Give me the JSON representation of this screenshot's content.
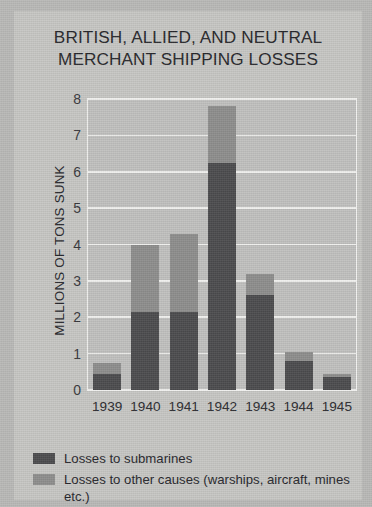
{
  "title": {
    "line1": "BRITISH, ALLIED, AND NEUTRAL",
    "line2": "MERCHANT SHIPPING LOSSES"
  },
  "axis": {
    "ylabel": "MILLIONS OF TONS SUNK"
  },
  "legend": {
    "items": [
      {
        "label": "Losses to submarines",
        "color": "#4c4c4e",
        "swatch_name": "legend-swatch-submarines"
      },
      {
        "label": "Losses to other causes (warships, aircraft, mines etc.)",
        "color": "#8d8d8c",
        "swatch_name": "legend-swatch-other"
      }
    ]
  },
  "colors": {
    "submarines": "#4c4c4e",
    "other_causes": "#8d8d8c",
    "plot_background": "#c0c0be",
    "card_background": "#c6c6c3",
    "page_background": "#b8b8b6",
    "gridline": "#f0f0ee",
    "text": "#25252a"
  },
  "chart_data": {
    "type": "bar",
    "subtype": "stacked-bar",
    "title": "BRITISH, ALLIED, AND NEUTRAL MERCHANT SHIPPING LOSSES",
    "xlabel": "",
    "ylabel": "MILLIONS OF TONS SUNK",
    "categories": [
      "1939",
      "1940",
      "1941",
      "1942",
      "1943",
      "1944",
      "1945"
    ],
    "series": [
      {
        "name": "Losses to submarines",
        "color": "#4c4c4e",
        "values": [
          0.45,
          2.15,
          2.15,
          6.25,
          2.6,
          0.8,
          0.35
        ]
      },
      {
        "name": "Losses to other causes (warships, aircraft, mines etc.)",
        "color": "#8d8d8c",
        "values": [
          0.3,
          1.85,
          2.15,
          1.55,
          0.6,
          0.25,
          0.1
        ]
      }
    ],
    "totals": [
      0.75,
      4.0,
      4.3,
      7.8,
      3.2,
      1.05,
      0.45
    ],
    "units": "millions of tons",
    "ylim": [
      0,
      8
    ],
    "yticks": [
      "0",
      "1",
      "2",
      "3",
      "4",
      "5",
      "6",
      "7",
      "8"
    ],
    "ytick_values": [
      0,
      1,
      2,
      3,
      4,
      5,
      6,
      7,
      8
    ],
    "grid": true,
    "grid_axis": "y",
    "legend_position": "below-plot-left",
    "stacked": true
  }
}
